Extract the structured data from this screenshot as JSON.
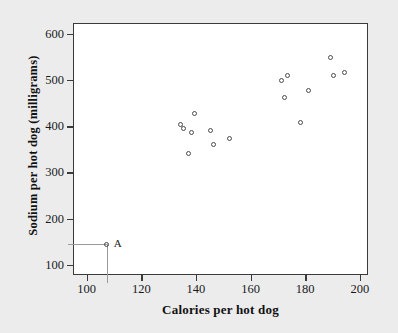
{
  "chart_data": {
    "type": "scatter",
    "title": "",
    "xlabel": "Calories per hot dog",
    "ylabel": "Sodium per hot dog (milligrams)",
    "xlim": [
      95,
      203
    ],
    "ylim": [
      78,
      623
    ],
    "xticks": [
      100,
      120,
      140,
      160,
      180,
      200
    ],
    "yticks": [
      100,
      200,
      300,
      400,
      500,
      600
    ],
    "xtick_labels": [
      "100",
      "120",
      "140",
      "160",
      "180",
      "200"
    ],
    "ytick_labels": [
      "100",
      "200",
      "300",
      "400",
      "500",
      "600"
    ],
    "grid": false,
    "legend": null,
    "marker": "open-circle",
    "marker_color": "#4a4a50",
    "background_color": "#ececed",
    "plot_background_color": "#ffffff",
    "frame_color": "#3a3a3a",
    "guide_color": "#9a9a9a",
    "x": [
      107,
      134,
      135,
      137,
      138,
      139,
      145,
      146,
      152,
      171,
      172,
      173,
      178,
      181,
      189,
      190,
      194
    ],
    "y": [
      147,
      405,
      396,
      342,
      389,
      430,
      392,
      363,
      376,
      500,
      463,
      512,
      410,
      479,
      551,
      512,
      518
    ],
    "points": [
      {
        "x": 107,
        "y": 147,
        "label": "A"
      },
      {
        "x": 134,
        "y": 405,
        "label": ""
      },
      {
        "x": 135,
        "y": 396,
        "label": ""
      },
      {
        "x": 137,
        "y": 342,
        "label": ""
      },
      {
        "x": 138,
        "y": 389,
        "label": ""
      },
      {
        "x": 139,
        "y": 430,
        "label": ""
      },
      {
        "x": 145,
        "y": 392,
        "label": ""
      },
      {
        "x": 146,
        "y": 363,
        "label": ""
      },
      {
        "x": 152,
        "y": 376,
        "label": ""
      },
      {
        "x": 171,
        "y": 500,
        "label": ""
      },
      {
        "x": 172,
        "y": 463,
        "label": ""
      },
      {
        "x": 173,
        "y": 512,
        "label": ""
      },
      {
        "x": 178,
        "y": 410,
        "label": ""
      },
      {
        "x": 181,
        "y": 479,
        "label": ""
      },
      {
        "x": 189,
        "y": 551,
        "label": ""
      },
      {
        "x": 190,
        "y": 512,
        "label": ""
      },
      {
        "x": 194,
        "y": 518,
        "label": ""
      }
    ],
    "annotations": [
      {
        "label": "A",
        "x": 107,
        "y": 147,
        "guide_to_x_axis": true,
        "guide_to_y_axis": true
      }
    ]
  }
}
